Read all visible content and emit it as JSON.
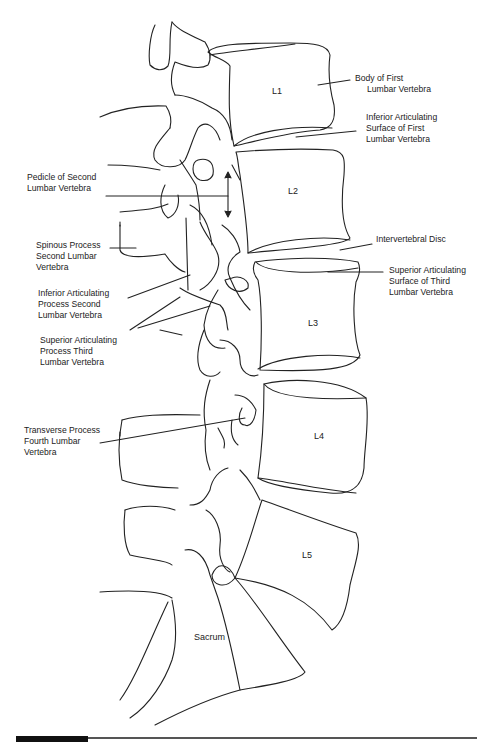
{
  "diagram": {
    "vertebra_labels": [
      {
        "id": "L1",
        "text": "L1"
      },
      {
        "id": "L2",
        "text": "L2"
      },
      {
        "id": "L3",
        "text": "L3"
      },
      {
        "id": "L4",
        "text": "L4"
      },
      {
        "id": "L5",
        "text": "L5"
      },
      {
        "id": "sacrum",
        "text": "Sacrum"
      }
    ],
    "callouts": [
      {
        "id": "body-first-lumbar",
        "text": "Body of First\n     Lumbar Vertebra"
      },
      {
        "id": "inferior-articulating-surface-first",
        "text": "Inferior Articulating\nSurface of First\nLumbar Vertebra"
      },
      {
        "id": "pedicle-second",
        "text": "Pedicle of Second\nLumbar Vertebra"
      },
      {
        "id": "spinous-process-second",
        "text": "Spinous Process\nSecond Lumbar\nVertebra"
      },
      {
        "id": "intervertebral-disc",
        "text": "Intervertebral Disc"
      },
      {
        "id": "superior-articulating-surface-third",
        "text": "Superior Articulating\nSurface of Third\nLumbar Vertebra"
      },
      {
        "id": "inferior-articulating-process-second",
        "text": "Inferior Articulating\nProcess Second\nLumbar Vertebra"
      },
      {
        "id": "superior-articulating-process-third",
        "text": "Superior Articulating\nProcess Third\nLumbar Vertebra"
      },
      {
        "id": "transverse-process-fourth",
        "text": "Transverse Process\nFourth Lumbar\nVertebra"
      }
    ]
  }
}
